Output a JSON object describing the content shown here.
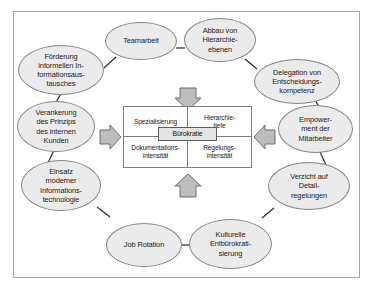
{
  "diagram": {
    "center": {
      "label": "Bürokratie",
      "quadrants": [
        {
          "id": "spezialisierung",
          "label": "Spezialisierung"
        },
        {
          "id": "hierarchietiefe",
          "label": "Hierarchie-\ntiefe"
        },
        {
          "id": "dokumentationsintensitaet",
          "label": "Dokumentations-\nintensität"
        },
        {
          "id": "regelungsintensitaet",
          "label": "Regelungs-\nintensität"
        }
      ]
    },
    "arrows": [
      {
        "id": "arrow-top",
        "direction": "down"
      },
      {
        "id": "arrow-left",
        "direction": "right"
      },
      {
        "id": "arrow-right",
        "direction": "left"
      },
      {
        "id": "arrow-bottom",
        "direction": "up"
      }
    ],
    "nodes": [
      {
        "id": "teamarbeit",
        "label": "Teamarbeit"
      },
      {
        "id": "abbau-hierarchieebenen",
        "label": "Abbau von\nHierarchie-\nebenen"
      },
      {
        "id": "delegation-entscheidungskompetenz",
        "label": "Delegation von\nEntscheidungs-\nkompetenz"
      },
      {
        "id": "empowerment-mitarbeiter",
        "label": "Empower-\nment der\nMitarbeiter"
      },
      {
        "id": "verzicht-detailregelungen",
        "label": "Verzicht auf\nDetail-\nregelungen"
      },
      {
        "id": "kulturelle-entbuerokratisierung",
        "label": "Kulturelle\nEntbürokrati-\nsierung"
      },
      {
        "id": "job-rotation",
        "label": "Job Rotation"
      },
      {
        "id": "einsatz-informationstechnologie",
        "label": "Einsatz\nmoderner\nInformations-\ntechnologie"
      },
      {
        "id": "verankerung-interner-kunde",
        "label": "Verankerung\ndes Prinzips\ndes internen\nKunden"
      },
      {
        "id": "foerderung-informationsaustausch",
        "label": "Förderung\ninformellen In-\nformationsaus-\ntausches"
      }
    ],
    "colors": {
      "node_fill": "#ebebeb",
      "node_stroke": "#868686",
      "box_fill": "#ffffff",
      "box_stroke": "#7d7d7d",
      "center_fill": "#e4e4e4",
      "arrow_fill": "#bdbdbd",
      "arrow_stroke": "#6e6e6e",
      "frame_stroke": "#a8a8a8",
      "connector_stroke": "#2b2b2b",
      "text": "#1a1a1a"
    }
  }
}
